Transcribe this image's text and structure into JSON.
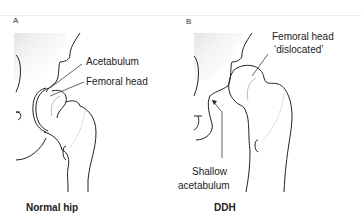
{
  "panels": [
    {
      "letter": "A",
      "caption": "Normal hip",
      "labels": {
        "acetabulum": "Acetabulum",
        "femoral_head": "Femoral head"
      }
    },
    {
      "letter": "B",
      "caption": "DDH",
      "labels": {
        "femoral_head_line1": "Femoral head",
        "femoral_head_line2": "‘dislocated’",
        "shallow_line1": "Shallow",
        "shallow_line2": "acetabulum"
      }
    }
  ],
  "colors": {
    "line": "#222222",
    "shade": "#e6e6e6",
    "background": "#ffffff"
  }
}
